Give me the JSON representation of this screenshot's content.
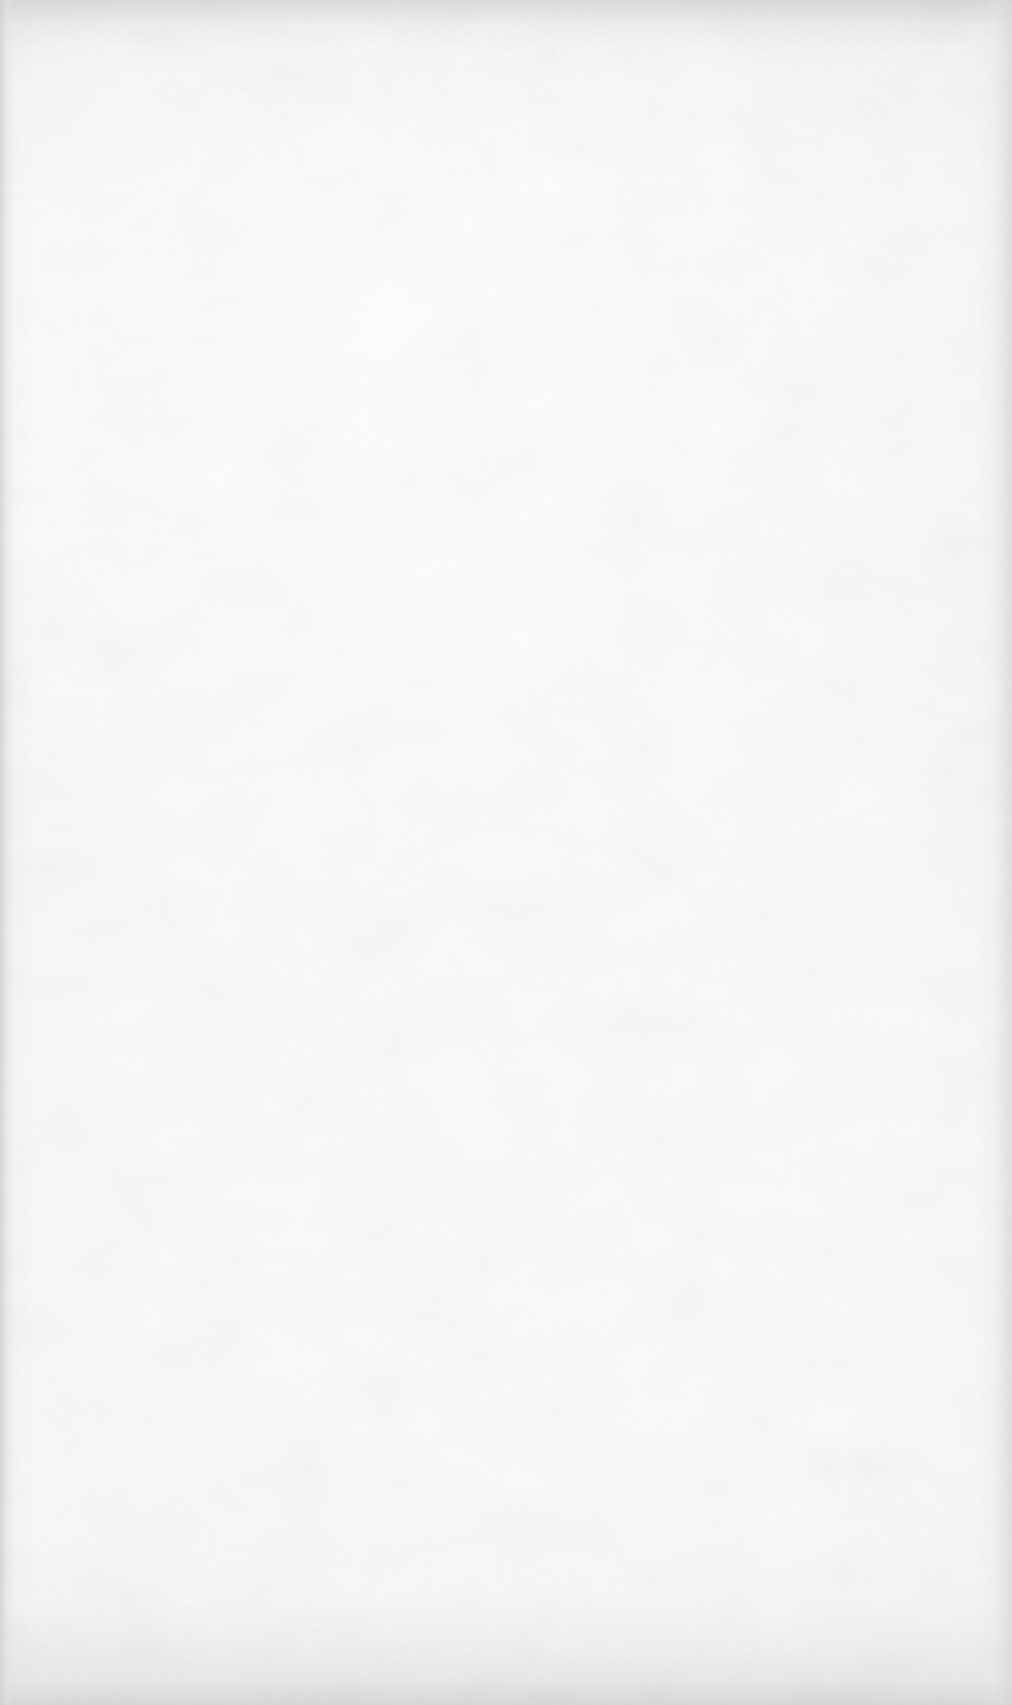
{
  "document": {
    "kind": "scanned-page",
    "page_state": "blank",
    "visible_text": [],
    "printed_content": "none",
    "notes": "No printed text, figures, rules, headers, footers, folios or marginalia are visible anywhere on the page."
  },
  "page": {
    "width_px": 1012,
    "height_px": 1705,
    "orientation": "portrait",
    "background_color": "#fbfbfb",
    "paper_tone_color": "#f7f7f8",
    "grain": "fine paper fibre speckle across the whole sheet",
    "illumination": "scanner lamp hot-spot toward the upper-centre, falling off to the margins"
  },
  "scan_artifacts": {
    "top_edge": {
      "label": "top scan edge band",
      "color": "#e9e9ea",
      "height_px": 52,
      "description": "darker, noisier strip along the top trim of the scan"
    },
    "bottom_edge": {
      "label": "bottom scan edge band",
      "color": "#e8e8e9",
      "height_px": 58,
      "description": "darker, noisier strip along the bottom trim of the scan"
    },
    "left_edge": {
      "label": "left gutter streak",
      "color": "#cecfd1",
      "width_px": 15,
      "description": "thin vertical darker streak at the extreme left margin"
    },
    "right_edge": {
      "label": "right margin falloff",
      "color": "#d6d6d9",
      "width_px": 34,
      "description": "faint vertical tonal transition near the right trim"
    }
  },
  "header": {
    "title": "",
    "folio": ""
  },
  "footer": {
    "page_number": "",
    "caption": ""
  },
  "body": {
    "paragraphs": [],
    "figures": [],
    "tables": []
  }
}
